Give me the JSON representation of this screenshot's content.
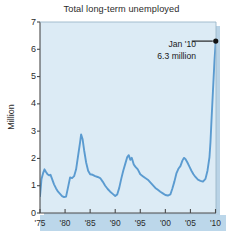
{
  "chart_data": {
    "type": "line",
    "title": "Total long-term unemployed",
    "xlabel": "",
    "ylabel": "Million",
    "xlim": [
      1975,
      2010.1
    ],
    "ylim": [
      0,
      7
    ],
    "grid": false,
    "legend": "none",
    "y_ticks": [
      0,
      1,
      2,
      3,
      4,
      5,
      6,
      7
    ],
    "y_tick_labels": [
      "0",
      "1",
      "2",
      "3",
      "4",
      "5",
      "6",
      "7"
    ],
    "x_ticks": [
      1975,
      1980,
      1985,
      1990,
      1995,
      2000,
      2005,
      2010
    ],
    "x_tick_labels": [
      "'75",
      "'80",
      "'85",
      "'90",
      "'95",
      "'00",
      "'05",
      "'10"
    ],
    "series": [
      {
        "name": "Total long-term unemployed",
        "color": "#5b9bd0",
        "x": [
          1975.0,
          1975.3,
          1975.6,
          1975.9,
          1976.2,
          1976.5,
          1976.8,
          1977.1,
          1977.4,
          1977.8,
          1978.2,
          1978.6,
          1979.0,
          1979.4,
          1979.8,
          1980.2,
          1980.6,
          1981.0,
          1981.4,
          1981.8,
          1982.2,
          1982.6,
          1983.0,
          1983.2,
          1983.5,
          1983.8,
          1984.2,
          1984.6,
          1985.0,
          1985.5,
          1986.0,
          1986.5,
          1987.0,
          1987.5,
          1988.0,
          1988.5,
          1989.0,
          1989.5,
          1990.0,
          1990.4,
          1990.8,
          1991.2,
          1991.6,
          1992.0,
          1992.4,
          1992.7,
          1993.0,
          1993.3,
          1993.7,
          1994.0,
          1994.5,
          1995.0,
          1995.5,
          1996.0,
          1996.5,
          1997.0,
          1997.5,
          1998.0,
          1998.5,
          1999.0,
          1999.5,
          2000.0,
          2000.5,
          2001.0,
          2001.4,
          2001.8,
          2002.2,
          2002.6,
          2003.0,
          2003.4,
          2003.7,
          2004.0,
          2004.4,
          2004.8,
          2005.2,
          2005.6,
          2006.0,
          2006.5,
          2007.0,
          2007.5,
          2008.0,
          2008.4,
          2008.8,
          2009.0,
          2009.2,
          2009.5,
          2009.8,
          2010.05
        ],
        "values": [
          0.62,
          1.25,
          1.45,
          1.6,
          1.5,
          1.42,
          1.38,
          1.4,
          1.25,
          1.05,
          0.9,
          0.78,
          0.7,
          0.62,
          0.58,
          0.6,
          0.95,
          1.3,
          1.28,
          1.35,
          1.6,
          2.1,
          2.6,
          2.88,
          2.7,
          2.3,
          1.85,
          1.55,
          1.42,
          1.4,
          1.35,
          1.32,
          1.28,
          1.15,
          1.0,
          0.88,
          0.78,
          0.7,
          0.62,
          0.68,
          0.92,
          1.25,
          1.55,
          1.8,
          2.05,
          2.12,
          1.95,
          2.02,
          1.78,
          1.7,
          1.6,
          1.42,
          1.35,
          1.28,
          1.22,
          1.12,
          1.02,
          0.92,
          0.85,
          0.78,
          0.72,
          0.66,
          0.64,
          0.68,
          0.9,
          1.15,
          1.45,
          1.62,
          1.72,
          1.92,
          2.02,
          1.98,
          1.85,
          1.7,
          1.55,
          1.42,
          1.32,
          1.22,
          1.18,
          1.15,
          1.25,
          1.55,
          2.05,
          2.6,
          3.4,
          4.5,
          5.6,
          6.3
        ]
      }
    ],
    "annotations": [
      {
        "label_line1": "Jan '10",
        "label_line2": "6.3 million",
        "point_x": 2010.05,
        "point_y": 6.3,
        "marker_color": "#111111",
        "leader_color": "#111111"
      }
    ],
    "style": {
      "plot_background": "#dcebf5",
      "axis_color": "#4a4a4a",
      "line_color": "#5b9bd0",
      "shadow_color": "#b9d3e6",
      "band_color": "#bcd7ea",
      "text_color": "#2b2b2b"
    }
  }
}
